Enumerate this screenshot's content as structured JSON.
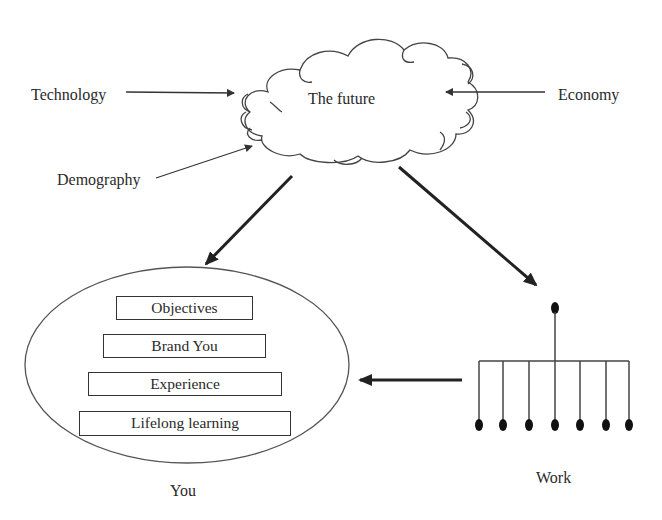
{
  "diagram": {
    "center": {
      "label": "The future",
      "shape": "cloud"
    },
    "influences": [
      {
        "label": "Technology",
        "direction": "right-to-cloud"
      },
      {
        "label": "Demography",
        "direction": "up-right-to-cloud"
      },
      {
        "label": "Economy",
        "direction": "left-to-cloud"
      }
    ],
    "you": {
      "label": "You",
      "shape": "ellipse",
      "items": [
        {
          "label": "Objectives"
        },
        {
          "label": "Brand You"
        },
        {
          "label": "Experience"
        },
        {
          "label": "Lifelong learning"
        }
      ]
    },
    "work": {
      "label": "Work",
      "shape": "org-chart",
      "child_nodes": 7
    },
    "edges": [
      {
        "from": "Technology",
        "to": "The future"
      },
      {
        "from": "Demography",
        "to": "The future"
      },
      {
        "from": "Economy",
        "to": "The future"
      },
      {
        "from": "The future",
        "to": "You"
      },
      {
        "from": "The future",
        "to": "Work"
      },
      {
        "from": "Work",
        "to": "You"
      }
    ],
    "colors": {
      "line": "#333333",
      "text": "#2a2a2a",
      "background": "#ffffff"
    }
  }
}
